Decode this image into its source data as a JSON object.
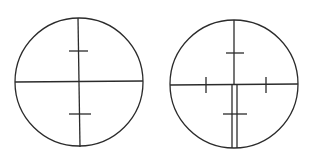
{
  "diagram": {
    "title": "",
    "background": "#ffffff",
    "stroke_color": "#2b2b2b",
    "reticles": [
      {
        "name": "reticle-left",
        "description": "Circle with full crosshair and two horizontal ticks on vertical axis",
        "circle": {
          "cx": 79,
          "cy": 82,
          "r": 64
        },
        "lines": [
          {
            "x1": 15,
            "y1": 82,
            "x2": 143,
            "y2": 81
          },
          {
            "x1": 78,
            "y1": 18,
            "x2": 80,
            "y2": 147
          },
          {
            "x1": 69,
            "y1": 51,
            "x2": 88,
            "y2": 51
          },
          {
            "x1": 69,
            "y1": 114,
            "x2": 91,
            "y2": 114
          }
        ]
      },
      {
        "name": "reticle-right",
        "description": "Circle with crosshair, side ticks, and double vertical line below center",
        "circle": {
          "cx": 234,
          "cy": 84,
          "r": 64
        },
        "lines": [
          {
            "x1": 170,
            "y1": 85,
            "x2": 298,
            "y2": 84
          },
          {
            "x1": 234,
            "y1": 20,
            "x2": 234,
            "y2": 85
          },
          {
            "x1": 226,
            "y1": 53,
            "x2": 244,
            "y2": 53
          },
          {
            "x1": 206,
            "y1": 77,
            "x2": 206,
            "y2": 93
          },
          {
            "x1": 266,
            "y1": 77,
            "x2": 266,
            "y2": 93
          },
          {
            "x1": 232,
            "y1": 85,
            "x2": 232,
            "y2": 148
          },
          {
            "x1": 237,
            "y1": 85,
            "x2": 237,
            "y2": 148
          },
          {
            "x1": 223,
            "y1": 114,
            "x2": 247,
            "y2": 114
          }
        ]
      }
    ]
  }
}
